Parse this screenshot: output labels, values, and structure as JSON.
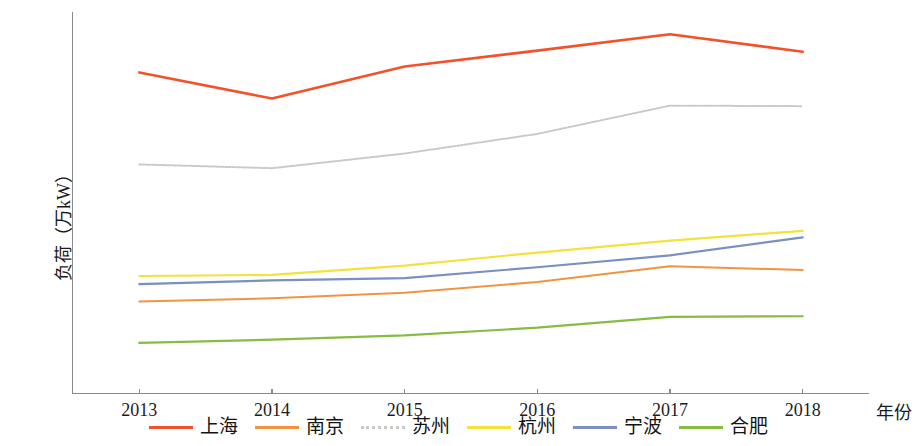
{
  "chart_data": {
    "type": "line",
    "title": "",
    "xlabel": "年份",
    "ylabel": "负荷（万kW）",
    "categories": [
      "2013",
      "2014",
      "2015",
      "2016",
      "2017",
      "2018"
    ],
    "x": [
      2013,
      2014,
      2015,
      2016,
      2017,
      2018
    ],
    "xlim": [
      2012.5,
      2018.5
    ],
    "ylim": [
      0,
      3500
    ],
    "yticks": [
      0,
      500,
      1000,
      1500,
      2000,
      2500,
      3000,
      3500
    ],
    "ytick_labels": [
      "0",
      "500",
      "1000",
      "1500",
      "2000",
      "2500",
      "3000",
      "3500"
    ],
    "grid": false,
    "legend_position": "bottom",
    "series": [
      {
        "name": "上海",
        "color": "#F2522A",
        "style": "solid",
        "width": 2.6,
        "values": [
          2945,
          2705,
          3000,
          3145,
          3295,
          3135
        ]
      },
      {
        "name": "南京",
        "color": "#EF9540",
        "style": "solid",
        "width": 2.0,
        "values": [
          840,
          870,
          920,
          1020,
          1165,
          1130
        ]
      },
      {
        "name": "苏州",
        "color": "#C9CAC4",
        "style": "dotted",
        "width": 2.0,
        "values": [
          2100,
          2065,
          2200,
          2380,
          2640,
          2635
        ]
      },
      {
        "name": "杭州",
        "color": "#F2E23B",
        "style": "solid",
        "width": 2.2,
        "values": [
          1075,
          1085,
          1170,
          1290,
          1400,
          1490
        ]
      },
      {
        "name": "宁波",
        "color": "#7A90BE",
        "style": "solid",
        "width": 2.2,
        "values": [
          1000,
          1035,
          1055,
          1155,
          1265,
          1430
        ]
      },
      {
        "name": "合肥",
        "color": "#86BC40",
        "style": "solid",
        "width": 2.2,
        "values": [
          460,
          490,
          530,
          600,
          700,
          705
        ]
      }
    ]
  },
  "axes": {
    "y_title": "负荷（万kW）",
    "x_title": "年份"
  },
  "legend": {
    "items": [
      {
        "label": "上海",
        "color": "#F2522A"
      },
      {
        "label": "南京",
        "color": "#EF9540"
      },
      {
        "label": "苏州",
        "color": "#C9CAC4"
      },
      {
        "label": "杭州",
        "color": "#F2E23B"
      },
      {
        "label": "宁波",
        "color": "#7A90BE"
      },
      {
        "label": "合肥",
        "color": "#86BC40"
      }
    ]
  }
}
